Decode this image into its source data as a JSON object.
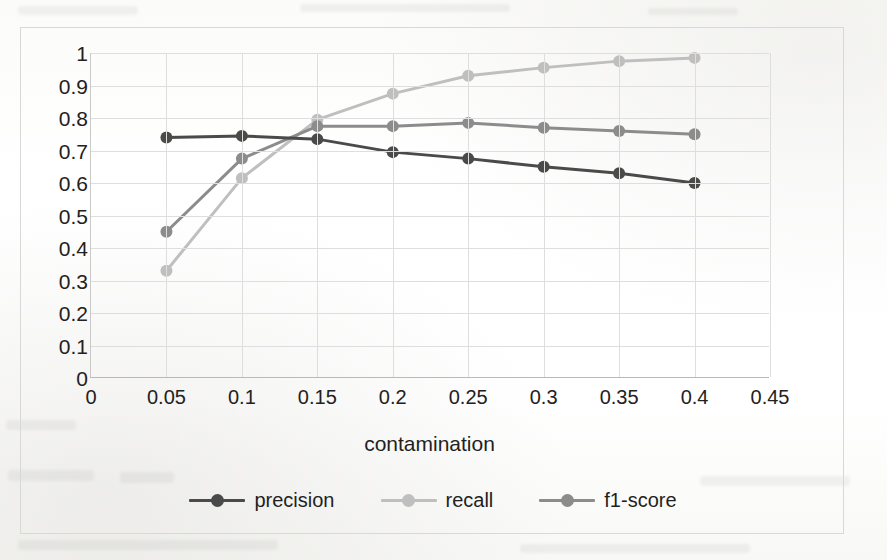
{
  "chart_data": {
    "type": "line",
    "title": "",
    "xlabel": "contamination",
    "ylabel": "",
    "xlim": [
      0,
      0.45
    ],
    "ylim": [
      0,
      1
    ],
    "grid": true,
    "legend_position": "bottom",
    "x": [
      0.05,
      0.1,
      0.15,
      0.2,
      0.25,
      0.3,
      0.35,
      0.4
    ],
    "x_ticks": [
      "0",
      "0.05",
      "0.1",
      "0.15",
      "0.2",
      "0.25",
      "0.3",
      "0.35",
      "0.4",
      "0.45"
    ],
    "x_tick_values": [
      0,
      0.05,
      0.1,
      0.15,
      0.2,
      0.25,
      0.3,
      0.35,
      0.4,
      0.45
    ],
    "y_ticks": [
      "1",
      "0.9",
      "0.8",
      "0.7",
      "0.6",
      "0.5",
      "0.4",
      "0.3",
      "0.2",
      "0.1",
      "0"
    ],
    "y_tick_values": [
      1,
      0.9,
      0.8,
      0.7,
      0.6,
      0.5,
      0.4,
      0.3,
      0.2,
      0.1,
      0
    ],
    "series": [
      {
        "name": "precision",
        "color": "#4a4a4a",
        "values": [
          0.74,
          0.745,
          0.735,
          0.695,
          0.675,
          0.65,
          0.63,
          0.6
        ]
      },
      {
        "name": "recall",
        "color": "#bfbfbf",
        "values": [
          0.33,
          0.615,
          0.795,
          0.875,
          0.93,
          0.955,
          0.975,
          0.985
        ]
      },
      {
        "name": "f1-score",
        "color": "#8c8c8c",
        "values": [
          0.45,
          0.675,
          0.775,
          0.775,
          0.785,
          0.77,
          0.76,
          0.75
        ]
      }
    ]
  },
  "legend": {
    "items": [
      {
        "label": "precision"
      },
      {
        "label": "recall"
      },
      {
        "label": "f1-score"
      }
    ]
  }
}
